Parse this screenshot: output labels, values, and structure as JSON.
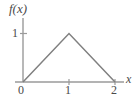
{
  "chart_data": {
    "type": "line",
    "title": "",
    "subtitle": "",
    "xlabel": "x",
    "ylabel": "f(x)",
    "x": [
      0,
      1,
      2
    ],
    "values": [
      0,
      1,
      0
    ],
    "series": [
      {
        "name": "f(x)",
        "x": [
          0,
          1,
          2
        ],
        "values": [
          0,
          1,
          0
        ]
      }
    ],
    "xlim": [
      0,
      2.25
    ],
    "ylim": [
      0,
      1.3
    ],
    "xticks": [
      0,
      1,
      2
    ],
    "xtick_labels": [
      "0",
      "1",
      "2"
    ],
    "yticks": [
      1
    ],
    "ytick_labels": [
      "1"
    ],
    "grid": false,
    "legend": null,
    "annotations": [],
    "line_color": "#808080",
    "axis_color": "#9a9a9a",
    "text_color": "#4a4a4a",
    "background": "#ffffff"
  },
  "labels": {
    "y_axis_label": "f(x)",
    "x_axis_label": "x",
    "y_tick_1": "1",
    "x_tick_0": "0",
    "x_tick_1": "1",
    "x_tick_2": "2"
  }
}
